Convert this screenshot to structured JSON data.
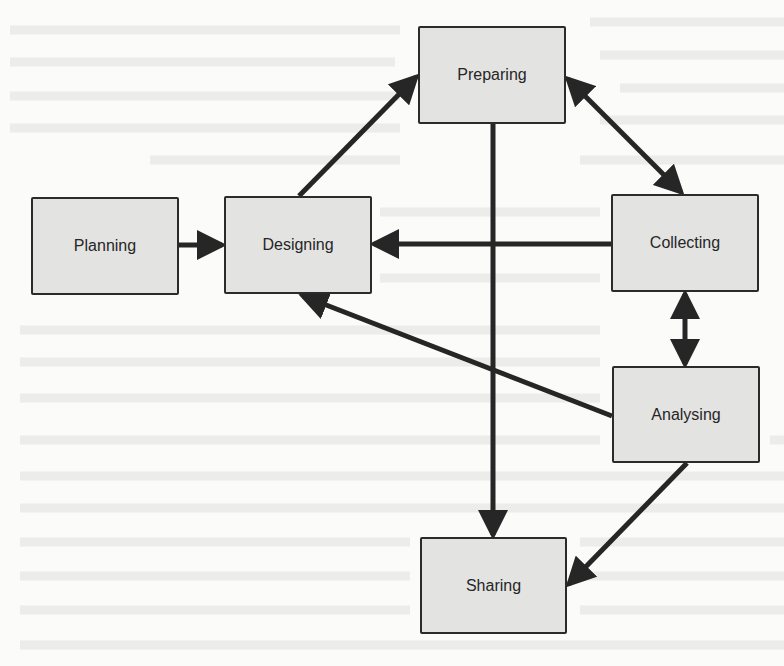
{
  "diagram": {
    "type": "process-flow",
    "colors": {
      "node_fill": "#e3e3e2",
      "node_border": "#2b2b2b",
      "edge": "#262626",
      "background": "#fbfbfa"
    },
    "nodes": [
      {
        "id": "planning",
        "label": "Planning",
        "x": 31,
        "y": 197,
        "w": 148,
        "h": 98
      },
      {
        "id": "designing",
        "label": "Designing",
        "x": 224,
        "y": 196,
        "w": 148,
        "h": 98
      },
      {
        "id": "preparing",
        "label": "Preparing",
        "x": 418,
        "y": 26,
        "w": 148,
        "h": 98
      },
      {
        "id": "collecting",
        "label": "Collecting",
        "x": 611,
        "y": 194,
        "w": 148,
        "h": 98
      },
      {
        "id": "analysing",
        "label": "Analysing",
        "x": 612,
        "y": 366,
        "w": 148,
        "h": 97
      },
      {
        "id": "sharing",
        "label": "Sharing",
        "x": 420,
        "y": 537,
        "w": 147,
        "h": 97
      }
    ],
    "edges": [
      {
        "from": "Planning",
        "to": "Designing",
        "direction": "forward"
      },
      {
        "from": "Designing",
        "to": "Preparing",
        "direction": "forward"
      },
      {
        "from": "Preparing",
        "to": "Collecting",
        "direction": "both"
      },
      {
        "from": "Collecting",
        "to": "Designing",
        "direction": "forward"
      },
      {
        "from": "Preparing",
        "to": "Sharing",
        "direction": "forward"
      },
      {
        "from": "Collecting",
        "to": "Analysing",
        "direction": "both"
      },
      {
        "from": "Analysing",
        "to": "Designing",
        "direction": "forward"
      },
      {
        "from": "Analysing",
        "to": "Sharing",
        "direction": "forward"
      }
    ]
  }
}
